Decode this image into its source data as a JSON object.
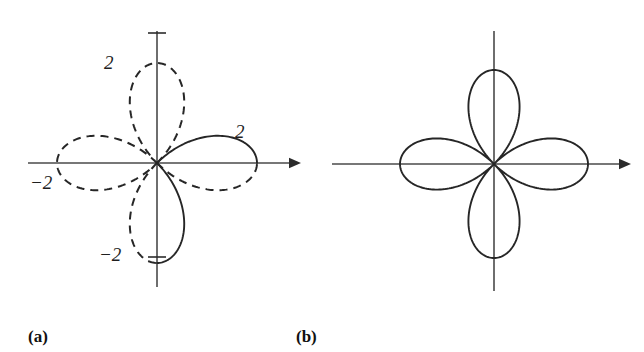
{
  "figure": {
    "width": 644,
    "height": 352,
    "background": "#ffffff",
    "curve_color": "#262626",
    "axis_color": "#4a4a4a"
  },
  "panels": [
    {
      "id": "a",
      "caption": "(a)",
      "caption_x": 28,
      "caption_y": 328,
      "center_x": 157,
      "center_y": 163,
      "petal_radius": 100,
      "axis": {
        "x_start": 28,
        "x_end": 292,
        "y_start": 31,
        "y_end": 287,
        "arrow_on_x": true,
        "arrow_on_y": false
      },
      "ticks": [
        {
          "name": "tick-top",
          "label": "2",
          "axis": "y",
          "value": 2,
          "x": 104,
          "y": 53
        },
        {
          "name": "tick-right",
          "label": "2",
          "axis": "x",
          "value": 2,
          "x": 235,
          "y": 122
        },
        {
          "name": "tick-left",
          "label": "−2",
          "axis": "x",
          "value": -2,
          "x": 30,
          "y": 173
        },
        {
          "name": "tick-bottom",
          "label": "−2",
          "axis": "y",
          "value": -2,
          "x": 99,
          "y": 245
        }
      ],
      "petals": [
        {
          "name": "petal-right",
          "angle_deg": 0,
          "style": "mixed",
          "solid_half": "upper"
        },
        {
          "name": "petal-top",
          "angle_deg": 90,
          "style": "dashed",
          "solid_half": "none"
        },
        {
          "name": "petal-left",
          "angle_deg": 180,
          "style": "dashed",
          "solid_half": "none"
        },
        {
          "name": "petal-bottom",
          "angle_deg": 270,
          "style": "mixed",
          "solid_half": "left"
        }
      ]
    },
    {
      "id": "b",
      "caption": "(b)",
      "caption_x": 296,
      "caption_y": 328,
      "center_x": 172,
      "center_y": 164,
      "petal_radius": 94,
      "axis": {
        "x_start": 10,
        "x_end": 300,
        "y_start": 31,
        "y_end": 291,
        "arrow_on_x": true,
        "arrow_on_y": false
      },
      "ticks": [],
      "petals": [
        {
          "name": "petal-right",
          "angle_deg": 0,
          "style": "solid",
          "solid_half": "all"
        },
        {
          "name": "petal-top",
          "angle_deg": 90,
          "style": "solid",
          "solid_half": "all"
        },
        {
          "name": "petal-left",
          "angle_deg": 180,
          "style": "solid",
          "solid_half": "all"
        },
        {
          "name": "petal-bottom",
          "angle_deg": 270,
          "style": "solid",
          "solid_half": "all"
        }
      ]
    }
  ],
  "chart_data": {
    "type": "line",
    "title": "",
    "xlabel": "",
    "ylabel": "",
    "coordinate_system": "polar",
    "grid": false,
    "legend": null,
    "xlim": [
      -2.6,
      2.6
    ],
    "ylim": [
      -2.6,
      2.6
    ],
    "tick_labels": [
      "2",
      "−2"
    ],
    "series": [
      {
        "name": "(a) four-petaled rose, partly dashed",
        "equation": "r = 2 cos 2θ",
        "petal_count": 4,
        "max_radius": 2,
        "petal_tip_values": [
          {
            "label": "2",
            "angle_deg": 0,
            "r": 2
          },
          {
            "label": "2",
            "angle_deg": 90,
            "r": 2
          },
          {
            "label": "−2",
            "angle_deg": 180,
            "r": 2
          },
          {
            "label": "−2",
            "angle_deg": 270,
            "r": 2
          }
        ],
        "linestyle": "mixed solid and dashed"
      },
      {
        "name": "(b) four-petaled rose, solid",
        "equation": "r = 2 cos 2θ",
        "petal_count": 4,
        "max_radius": 2,
        "petal_tip_values": [
          {
            "angle_deg": 0,
            "r": 2
          },
          {
            "angle_deg": 90,
            "r": 2
          },
          {
            "angle_deg": 180,
            "r": 2
          },
          {
            "angle_deg": 270,
            "r": 2
          }
        ],
        "linestyle": "solid"
      }
    ]
  }
}
